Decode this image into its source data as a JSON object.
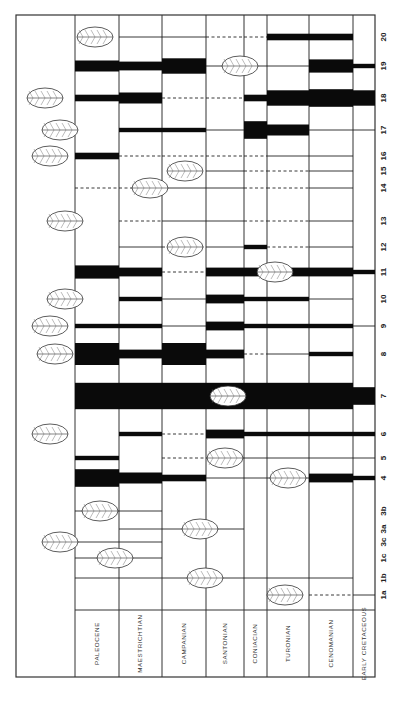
{
  "chart_data": {
    "type": "range-chart",
    "title": "",
    "orientation": "rotated-90",
    "xlabel": "",
    "ylabel": "",
    "stages": [
      "PALEOCENE",
      "MAESTRICHTIAN",
      "CAMPANIAN",
      "SANTONIAN",
      "CONIACIAN",
      "TURONIAN",
      "CENOMANIAN",
      "EARLY CRETACEOUS"
    ],
    "legend": "bar thickness = relative abundance; thin line = present/rare; dashed = inferred range",
    "taxa": [
      {
        "id": "20",
        "ranges": [
          0,
          "line",
          "line",
          "dash",
          "dash",
          3,
          3,
          0
        ]
      },
      {
        "id": "19",
        "ranges": [
          5,
          4,
          7,
          "line",
          "line",
          "line",
          6,
          2
        ]
      },
      {
        "id": "18",
        "ranges": [
          3,
          5,
          "dash",
          "dash",
          3,
          7,
          8,
          7
        ]
      },
      {
        "id": "17",
        "ranges": [
          0,
          2,
          2,
          "line",
          8,
          5,
          "line",
          "line"
        ]
      },
      {
        "id": "16",
        "ranges": [
          3,
          "dash",
          "dash",
          "dash",
          "dash",
          "line",
          "line",
          0
        ]
      },
      {
        "id": "15",
        "ranges": [
          0,
          0,
          0,
          "line",
          "dash",
          "dash",
          "line",
          0
        ]
      },
      {
        "id": "14",
        "ranges": [
          "dash",
          "dash",
          "line",
          "line",
          "dash",
          "dash",
          "line",
          0
        ]
      },
      {
        "id": "13",
        "ranges": [
          0,
          "dash",
          "line",
          "line",
          "dash",
          "dash",
          "line",
          0
        ]
      },
      {
        "id": "12",
        "ranges": [
          0,
          "line",
          "dash",
          "line",
          2,
          "dash",
          "line",
          0
        ]
      },
      {
        "id": "11",
        "ranges": [
          6,
          4,
          "dash",
          4,
          4,
          4,
          4,
          2
        ]
      },
      {
        "id": "10",
        "ranges": [
          0,
          2,
          "line",
          4,
          2,
          2,
          "line",
          0
        ]
      },
      {
        "id": "9",
        "ranges": [
          2,
          2,
          "line",
          4,
          2,
          2,
          2,
          "line"
        ]
      },
      {
        "id": "8",
        "ranges": [
          10,
          4,
          10,
          4,
          "dash",
          "line",
          2,
          0
        ]
      },
      {
        "id": "7",
        "ranges": [
          12,
          12,
          12,
          12,
          12,
          12,
          12,
          8
        ]
      },
      {
        "id": "6",
        "ranges": [
          0,
          2,
          "dash",
          4,
          2,
          2,
          2,
          2
        ]
      },
      {
        "id": "5",
        "ranges": [
          2,
          0,
          "dash",
          "line",
          "line",
          "line",
          "line",
          "line"
        ]
      },
      {
        "id": "4",
        "ranges": [
          8,
          5,
          3,
          "line",
          "line",
          "line",
          4,
          2
        ]
      },
      {
        "id": "3b",
        "ranges": [
          "line",
          "line",
          0,
          0,
          0,
          0,
          0,
          0
        ]
      },
      {
        "id": "3a",
        "ranges": [
          0,
          "line",
          "line",
          "line",
          0,
          0,
          0,
          0
        ]
      },
      {
        "id": "3c",
        "ranges": [
          "line",
          "line",
          0,
          0,
          0,
          0,
          0,
          0
        ]
      },
      {
        "id": "1c",
        "ranges": [
          "line",
          "line",
          0,
          0,
          0,
          0,
          0,
          0
        ]
      },
      {
        "id": "1b",
        "ranges": [
          "line",
          "line",
          "line",
          "line",
          "line",
          "line",
          "line",
          0
        ]
      },
      {
        "id": "1a",
        "ranges": [
          0,
          0,
          0,
          0,
          0,
          0,
          "dash",
          "line"
        ]
      }
    ],
    "leaf_icons": {
      "20": "pinnate-chevron-leaf",
      "19": "round-cordate-leaf",
      "18": "trilobed-leaf",
      "17": "elliptic-leaf",
      "16": "elliptic-leaf",
      "15": "small-clasping-leaf",
      "14": "palmate-leaf",
      "13": "bilobed-leaf",
      "12": "pinnatifid-leaf",
      "11": "pinnatifid-leaf",
      "10": "serrate-elliptic-leaf",
      "9": "serrate-ovate-leaf",
      "8": "serrate-elliptic-leaf",
      "7": "entire-elliptic-leaf",
      "6": "ovate-leaf",
      "5": "peltate-round-leaf",
      "4": "cordate-leaf",
      "3b": "pinnate-frond",
      "3a": "fan-frond",
      "3c": "fan-palm",
      "1c": "linear-leaf",
      "1b": "striate-leaf",
      "1a": "strap-leaf"
    }
  }
}
